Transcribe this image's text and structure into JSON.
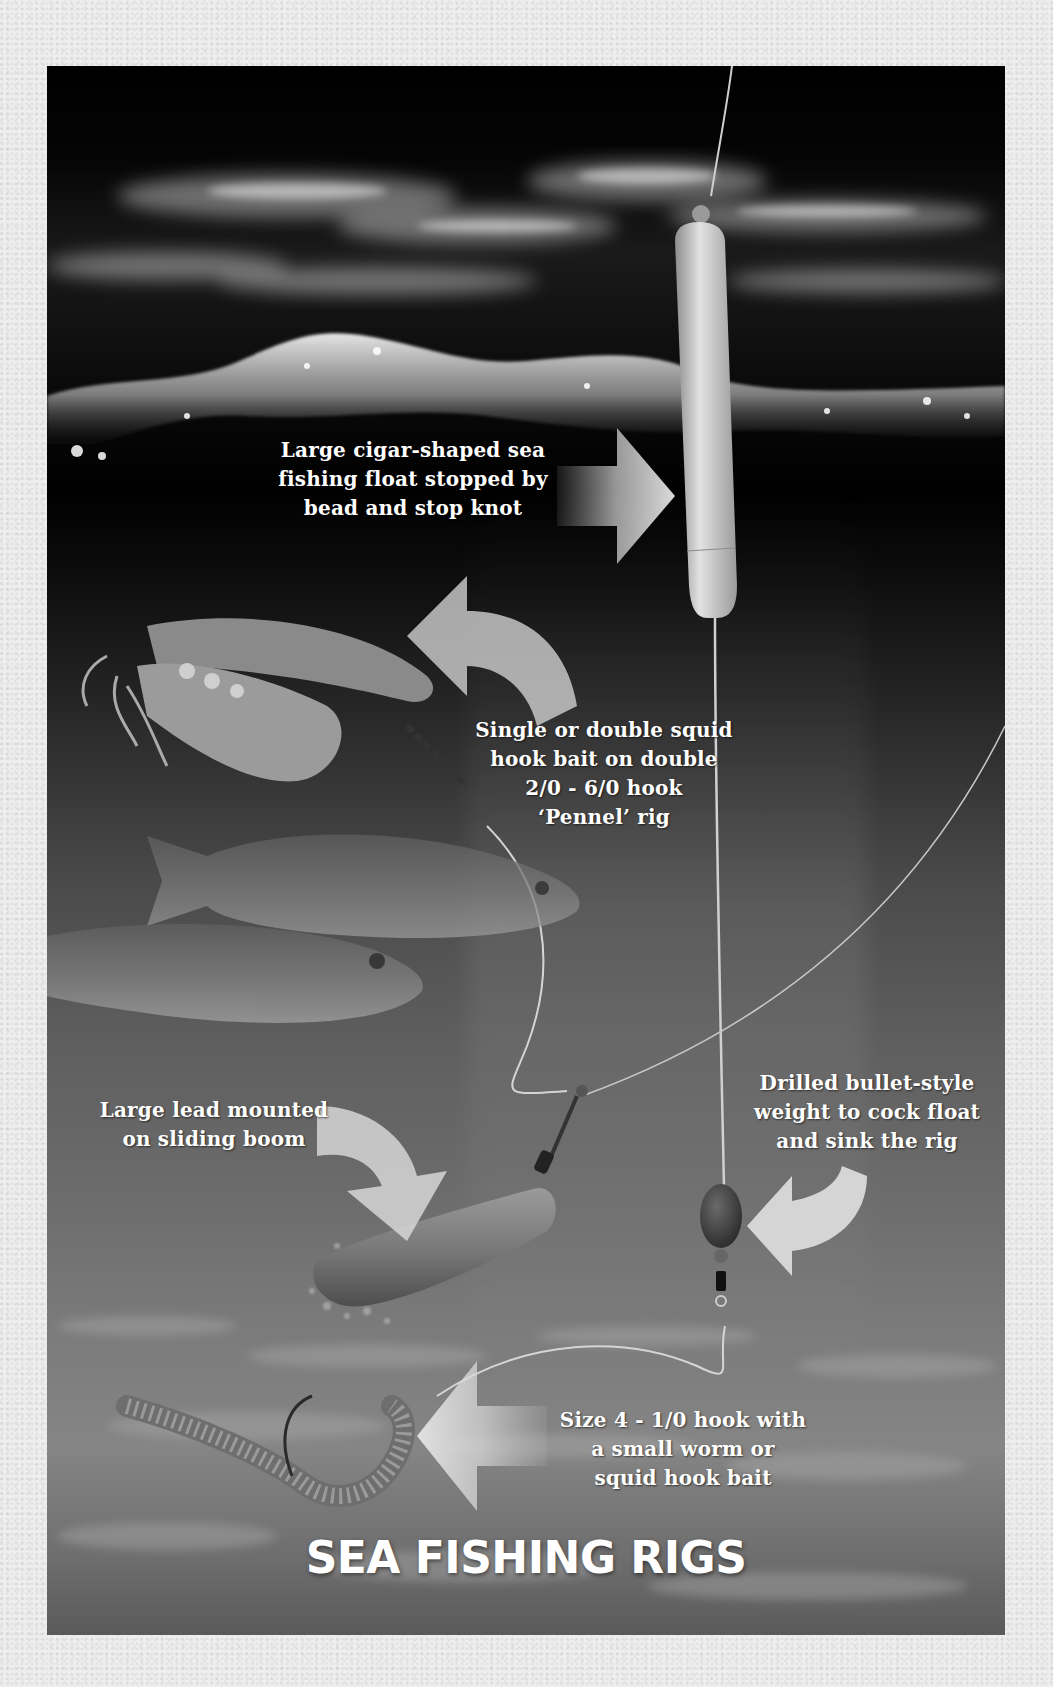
{
  "title": "SEA FISHING RIGS",
  "labels": {
    "float": "Large cigar-shaped sea\nfishing float stopped by\nbead and stop knot",
    "squid_bait": "Single or double squid\nhook bait on double\n2/0 - 6/0 hook\n‘Pennel’ rig",
    "lead": "Large lead mounted\non sliding boom",
    "bullet_weight": "Drilled bullet-style\nweight to cock float\nand sink the rig",
    "hook": "Size 4 - 1/0 hook with\na small worm or\nsquid hook bait"
  },
  "components": [
    {
      "name": "float",
      "icon": "cigar-float-icon"
    },
    {
      "name": "squid-bait",
      "icon": "squid-icon"
    },
    {
      "name": "fish",
      "icon": "fish-icon",
      "count": 2
    },
    {
      "name": "lead",
      "icon": "lead-weight-icon"
    },
    {
      "name": "bullet-weight",
      "icon": "bullet-weight-icon"
    },
    {
      "name": "worm-bait",
      "icon": "worm-icon"
    }
  ],
  "arrows": [
    {
      "target": "float",
      "direction": "right"
    },
    {
      "target": "squid-bait",
      "direction": "curved-left"
    },
    {
      "target": "lead",
      "direction": "curved-down"
    },
    {
      "target": "bullet-weight",
      "direction": "curved-left"
    },
    {
      "target": "worm-bait",
      "direction": "left"
    }
  ],
  "colors": {
    "paper": "#eeeeee",
    "sky": "#000000",
    "text": "#ffffff",
    "float": "#cfcfcf",
    "arrow": "#d8d8d8"
  }
}
